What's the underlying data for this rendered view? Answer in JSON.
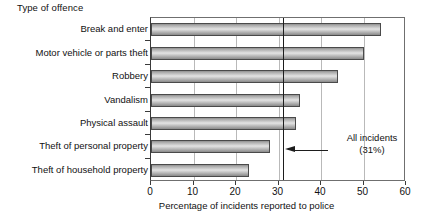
{
  "chart_data": {
    "type": "bar",
    "orientation": "horizontal",
    "title": "",
    "ylabel": "Type of offence",
    "xlabel": "Percentage of incidents reported to police",
    "categories": [
      "Break and enter",
      "Motor vehicle or parts theft",
      "Robbery",
      "Vandalism",
      "Physical assault",
      "Theft of personal property",
      "Theft of household property"
    ],
    "values": [
      54,
      50,
      44,
      35,
      34,
      28,
      23
    ],
    "xlim": [
      0,
      60
    ],
    "xticks": [
      0,
      10,
      20,
      30,
      40,
      50,
      60
    ],
    "xtick_labels": [
      "0",
      "10",
      "20",
      "30",
      "40",
      "50",
      "60"
    ],
    "grid": "vertical",
    "legend": "none",
    "annotations": [
      {
        "name": "all-incidents-reference",
        "label_line1": "All incidents",
        "label_line2": "(31%)",
        "value": 31,
        "style": "vertical-reference-line-with-arrow"
      }
    ]
  },
  "colors": {
    "bar_fill_light": "#e3e3e3",
    "bar_fill_mid": "#cfcfcf",
    "bar_fill_dark": "#8a8a8a",
    "bar_border": "#4a4a4a",
    "gridline": "#b9b9b9",
    "axis": "#3a3a3a",
    "reference_line": "#1d1d1d",
    "text": "#111111",
    "background": "#ffffff"
  }
}
